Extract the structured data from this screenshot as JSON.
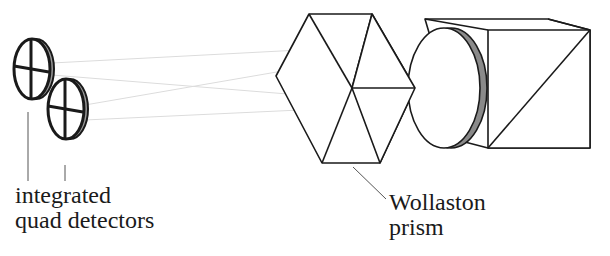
{
  "diagram": {
    "labels": {
      "detectors": {
        "line1": "integrated",
        "line2": "quad detectors"
      },
      "prism": {
        "line1": "Wollaston",
        "line2": "prism"
      }
    },
    "components": [
      {
        "name": "quad-detector",
        "count": 2
      },
      {
        "name": "wollaston-prism",
        "shape": "hexagonal-block"
      },
      {
        "name": "lens-disc",
        "edge_color": "#8a8a8a"
      },
      {
        "name": "beam-splitter-cube"
      }
    ],
    "colors": {
      "stroke": "#1a1a1a",
      "disc_edge": "#8a8a8a",
      "beam": "#d8d8d8",
      "background": "#ffffff"
    }
  }
}
